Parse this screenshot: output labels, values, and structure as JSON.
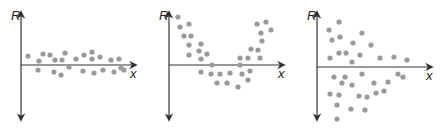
{
  "colors": {
    "axis": "#333333",
    "dot": "#9a9a9a",
    "background": "#ffffff"
  },
  "chart_data": [
    {
      "type": "scatter",
      "title": "",
      "ylabel": "R",
      "xlabel": "x",
      "description": "Residuals randomly scattered in a horizontal band around zero",
      "axis": {
        "x0": 21,
        "y_top": 12,
        "y_bottom": 120,
        "y_zero": 65,
        "x_end": 136
      },
      "points": [
        [
          28,
          56
        ],
        [
          39,
          61
        ],
        [
          43,
          54
        ],
        [
          50,
          55
        ],
        [
          55,
          60
        ],
        [
          62,
          60
        ],
        [
          65,
          53
        ],
        [
          76,
          59
        ],
        [
          84,
          55
        ],
        [
          92,
          52
        ],
        [
          92,
          59
        ],
        [
          100,
          57
        ],
        [
          111,
          60
        ],
        [
          119,
          59
        ],
        [
          38,
          70
        ],
        [
          54,
          72
        ],
        [
          61,
          75
        ],
        [
          69,
          67
        ],
        [
          83,
          71
        ],
        [
          94,
          73
        ],
        [
          103,
          70
        ],
        [
          114,
          72
        ],
        [
          121,
          68
        ],
        [
          124,
          70
        ]
      ]
    },
    {
      "type": "scatter",
      "title": "",
      "ylabel": "R",
      "xlabel": "x",
      "description": "Residuals form a U-shaped (curved) pattern",
      "axis": {
        "x0": 169,
        "y_top": 12,
        "y_bottom": 120,
        "y_zero": 65,
        "x_end": 284
      },
      "points": [
        [
          178,
          17
        ],
        [
          180,
          27
        ],
        [
          189,
          24
        ],
        [
          184,
          36
        ],
        [
          191,
          36
        ],
        [
          189,
          45
        ],
        [
          201,
          44
        ],
        [
          189,
          55
        ],
        [
          199,
          51
        ],
        [
          207,
          54
        ],
        [
          201,
          59
        ],
        [
          212,
          65
        ],
        [
          201,
          72
        ],
        [
          211,
          74
        ],
        [
          220,
          74
        ],
        [
          230,
          73
        ],
        [
          217,
          83
        ],
        [
          227,
          83
        ],
        [
          240,
          58
        ],
        [
          248,
          58
        ],
        [
          240,
          65
        ],
        [
          242,
          74
        ],
        [
          250,
          71
        ],
        [
          248,
          80
        ],
        [
          238,
          87
        ],
        [
          251,
          49
        ],
        [
          260,
          58
        ],
        [
          258,
          50
        ],
        [
          262,
          41
        ],
        [
          261,
          33
        ],
        [
          257,
          24
        ],
        [
          266,
          22
        ],
        [
          271,
          30
        ]
      ]
    },
    {
      "type": "scatter",
      "title": "",
      "ylabel": "R",
      "xlabel": "x",
      "description": "Residuals fan out — spread decreases as x increases (non-constant variance)",
      "axis": {
        "x0": 317,
        "y_top": 12,
        "y_bottom": 120,
        "y_zero": 67,
        "x_end": 432
      },
      "points": [
        [
          339,
          22
        ],
        [
          329,
          30
        ],
        [
          332,
          40
        ],
        [
          340,
          37
        ],
        [
          362,
          33
        ],
        [
          353,
          43
        ],
        [
          371,
          45
        ],
        [
          330,
          58
        ],
        [
          339,
          53
        ],
        [
          346,
          53
        ],
        [
          360,
          55
        ],
        [
          352,
          62
        ],
        [
          380,
          58
        ],
        [
          394,
          57
        ],
        [
          407,
          60
        ],
        [
          334,
          77
        ],
        [
          345,
          77
        ],
        [
          342,
          83
        ],
        [
          352,
          85
        ],
        [
          362,
          74
        ],
        [
          374,
          83
        ],
        [
          388,
          82
        ],
        [
          398,
          74
        ],
        [
          403,
          77
        ],
        [
          330,
          94
        ],
        [
          339,
          95
        ],
        [
          337,
          105
        ],
        [
          359,
          96
        ],
        [
          367,
          97
        ],
        [
          376,
          93
        ],
        [
          365,
          110
        ],
        [
          351,
          109
        ],
        [
          337,
          119
        ],
        [
          384,
          91
        ]
      ]
    }
  ]
}
